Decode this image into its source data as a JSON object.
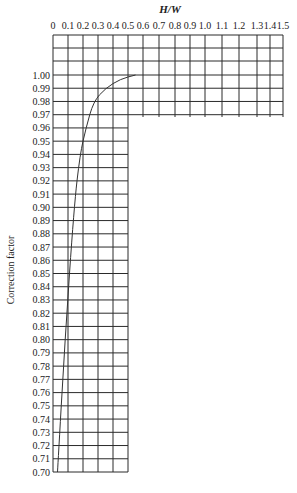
{
  "chart_data": {
    "type": "line",
    "title": "H/W",
    "xlabel": "H/W",
    "ylabel": "Correction factor",
    "x_ticks": [
      "0",
      "0.1",
      "0.2",
      "0.3",
      "0.4",
      "0.5",
      "0.6",
      "0.7",
      "0.8",
      "0.9",
      "1.0",
      "1.1",
      "1.2",
      "1.3",
      "1.4",
      "1.5"
    ],
    "y_ticks": [
      "1.00",
      "0.99",
      "0.98",
      "0.97",
      "0.96",
      "0.95",
      "0.94",
      "0.93",
      "0.92",
      "0.91",
      "0.90",
      "0.89",
      "0.88",
      "0.87",
      "0.86",
      "0.85",
      "0.84",
      "0.83",
      "0.82",
      "0.81",
      "0.80",
      "0.79",
      "0.78",
      "0.77",
      "0.76",
      "0.75",
      "0.74",
      "0.73",
      "0.72",
      "0.71",
      "0.70"
    ],
    "xlim": [
      0,
      1.5
    ],
    "ylim": [
      0.7,
      1.0
    ],
    "grid": true,
    "legend": null,
    "series": [
      {
        "name": "Correction factor",
        "x": [
          0.03,
          0.08,
          0.14,
          0.18,
          0.22,
          0.27,
          0.35,
          0.45,
          0.55
        ],
        "values": [
          0.7,
          0.8,
          0.9,
          0.94,
          0.96,
          0.98,
          0.99,
          0.997,
          1.0
        ]
      }
    ]
  }
}
